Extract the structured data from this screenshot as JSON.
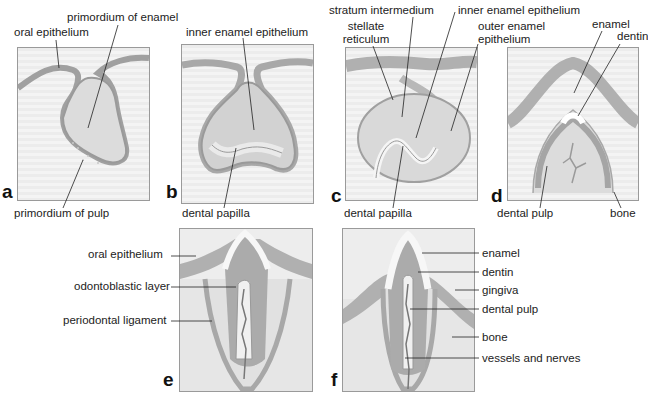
{
  "figure": {
    "panels": [
      {
        "id": "a",
        "letter": "a",
        "labels": [
          "oral epithelium",
          "primordium of enamel",
          "primordium of pulp"
        ]
      },
      {
        "id": "b",
        "letter": "b",
        "labels": [
          "inner enamel epithelium",
          "dental papilla"
        ]
      },
      {
        "id": "c",
        "letter": "c",
        "labels": [
          "stratum intermedium",
          "stellate reticulum",
          "inner enamel epithelium",
          "outer enamel epithelium",
          "dental papilla"
        ]
      },
      {
        "id": "d",
        "letter": "d",
        "labels": [
          "enamel",
          "dentin",
          "dental pulp",
          "bone"
        ]
      },
      {
        "id": "e",
        "letter": "e",
        "labels": [
          "oral epithelium",
          "odontoblastic layer",
          "periodontal ligament"
        ]
      },
      {
        "id": "f",
        "letter": "f",
        "labels": [
          "enamel",
          "dentin",
          "gingiva",
          "dental pulp",
          "bone",
          "vessels and nerves"
        ]
      }
    ]
  },
  "labels": {
    "a_oral_epithelium": "oral epithelium",
    "a_primordium_enamel": "primordium of enamel",
    "a_primordium_pulp": "primordium of pulp",
    "b_inner_enamel": "inner enamel epithelium",
    "b_dental_papilla": "dental papilla",
    "c_stratum": "stratum intermedium",
    "c_stellate_1": "stellate",
    "c_stellate_2": "reticulum",
    "c_inner_enamel": "inner enamel epithelium",
    "c_outer_1": "outer enamel",
    "c_outer_2": "epithelium",
    "c_dental_papilla": "dental papilla",
    "d_enamel": "enamel",
    "d_dentin": "dentin",
    "d_dental_pulp": "dental pulp",
    "d_bone": "bone",
    "e_oral_epithelium": "oral epithelium",
    "e_odontoblastic": "odontoblastic layer",
    "e_periodontal": "periodontal ligament",
    "f_enamel": "enamel",
    "f_dentin": "dentin",
    "f_gingiva": "gingiva",
    "f_dental_pulp": "dental pulp",
    "f_bone": "bone",
    "f_vessels": "vessels and nerves"
  },
  "letters": {
    "a": "a",
    "b": "b",
    "c": "c",
    "d": "d",
    "e": "e",
    "f": "f"
  },
  "colors": {
    "epithelium": "#b5b5b5",
    "tissue": "#d8d8d8",
    "enamel": "#f7f7f7",
    "dentin": "#a9a9a9",
    "outline": "#8a8a8a",
    "leader": "#222222"
  }
}
